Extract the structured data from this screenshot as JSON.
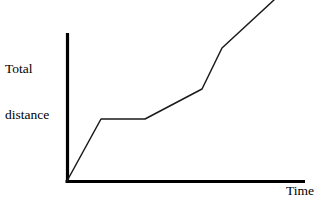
{
  "figure": {
    "background_color": "#ffffff",
    "width": 317,
    "height": 198,
    "clipped_fragment_text": "ty"
  },
  "labels": {
    "y_axis_line1": "Total",
    "y_axis_line2": "distance",
    "x_axis": "Time"
  },
  "chart_data": {
    "type": "line",
    "title": "",
    "subtitle": "",
    "xlabel": "Time",
    "ylabel": "Total distance",
    "grid": false,
    "legend": false,
    "legend_position": "none",
    "axis_color": "#000000",
    "line_color": "#1a1a1a",
    "line_width": 1.5,
    "axis_width": 3,
    "xlim": [
      0,
      100
    ],
    "ylim": [
      0,
      100
    ],
    "x_tick_labels": [],
    "y_tick_labels": [],
    "annotations": [],
    "series": [
      {
        "name": "Total distance",
        "x": [
          0,
          14.3,
          32.8,
          56.7,
          65.1,
          86.9
        ],
        "y": [
          0,
          41.9,
          41.9,
          62.2,
          89.9,
          122.3
        ],
        "segments": [
          {
            "label": "steady travel",
            "slope": "steep"
          },
          {
            "label": "stopped / plateau",
            "slope": "flat"
          },
          {
            "label": "slow travel",
            "slope": "gentle"
          },
          {
            "label": "fast travel",
            "slope": "steep"
          },
          {
            "label": "continued travel",
            "slope": "moderate"
          }
        ]
      }
    ],
    "pixel_geometry": {
      "origin": [
        67,
        181
      ],
      "y_axis_top": [
        67,
        33
      ],
      "x_axis_right": [
        305,
        181
      ],
      "polyline_points": "67,181 101,119 145,119 202,89 222,48 274,0"
    }
  }
}
